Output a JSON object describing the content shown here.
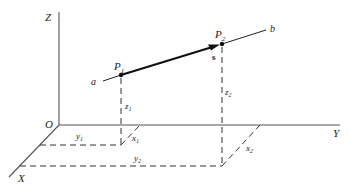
{
  "diagram": {
    "axes": {
      "x_label": "X",
      "y_label": "Y",
      "z_label": "Z",
      "origin_label": "O"
    },
    "line": {
      "start_label": "a",
      "end_label": "b",
      "vector_label": "s"
    },
    "points": [
      {
        "name": "P",
        "sub": "1",
        "z": "z",
        "z_sub": "1",
        "x": "x",
        "x_sub": "1",
        "y": "y",
        "y_sub": "1"
      },
      {
        "name": "P",
        "sub": "2",
        "z": "z",
        "z_sub": "2",
        "x": "x",
        "x_sub": "2",
        "y": "y",
        "y_sub": "2"
      }
    ],
    "colors": {
      "ink": "#222222",
      "axis": "#555555",
      "background": "#ffffff"
    }
  }
}
